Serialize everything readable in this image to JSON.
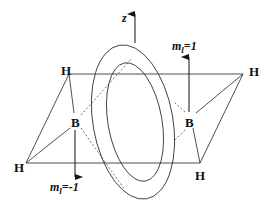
{
  "diagram": {
    "type": "molecular orbital schematic (diborane B2H6 bridging ring)",
    "axis_label": "z",
    "atoms": {
      "h_top_left": "H",
      "h_top_right": "H",
      "h_bottom_left": "H",
      "h_bottom_right": "H",
      "b_left": "B",
      "b_right": "B"
    },
    "annotations": {
      "ml_plus": {
        "m": "m",
        "sub": "l",
        "rest": "=1"
      },
      "ml_minus": {
        "m": "m",
        "sub": "l",
        "rest": "=-1"
      }
    },
    "colors": {
      "line": "#222222",
      "background": "#ffffff"
    }
  }
}
